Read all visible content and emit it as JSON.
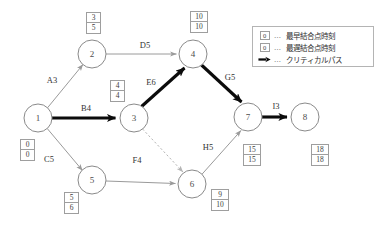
{
  "diagram": {
    "type": "pert-cpm-network",
    "nodes": [
      {
        "id": "1",
        "label": "1",
        "cx": 38,
        "cy": 118,
        "r": 14,
        "earliest": "0",
        "latest": "0",
        "box_x": 20,
        "box_y": 139
      },
      {
        "id": "2",
        "label": "2",
        "cx": 92,
        "cy": 54,
        "r": 14,
        "earliest": "3",
        "latest": "5",
        "box_x": 86,
        "box_y": 12
      },
      {
        "id": "3",
        "label": "3",
        "cx": 134,
        "cy": 118,
        "r": 14,
        "earliest": "4",
        "latest": "4",
        "box_x": 110,
        "box_y": 80
      },
      {
        "id": "4",
        "label": "4",
        "cx": 193,
        "cy": 54,
        "r": 14,
        "earliest": "10",
        "latest": "10",
        "box_x": 190,
        "box_y": 11
      },
      {
        "id": "5",
        "label": "5",
        "cx": 92,
        "cy": 180,
        "r": 14,
        "earliest": "5",
        "latest": "6",
        "box_x": 64,
        "box_y": 192
      },
      {
        "id": "6",
        "label": "6",
        "cx": 192,
        "cy": 184,
        "r": 14,
        "earliest": "9",
        "latest": "10",
        "box_x": 211,
        "box_y": 189
      },
      {
        "id": "7",
        "label": "7",
        "cx": 248,
        "cy": 117,
        "r": 14,
        "earliest": "15",
        "latest": "15",
        "box_x": 243,
        "box_y": 144
      },
      {
        "id": "8",
        "label": "8",
        "cx": 305,
        "cy": 117,
        "r": 14,
        "earliest": "18",
        "latest": "18",
        "box_x": 311,
        "box_y": 144
      }
    ],
    "edges": [
      {
        "name": "A3",
        "from": "1",
        "to": "2",
        "label": "A3",
        "duration": 3,
        "critical": false,
        "dummy": false,
        "label_x": 52,
        "label_y": 83
      },
      {
        "name": "B4",
        "from": "1",
        "to": "3",
        "label": "B4",
        "duration": 4,
        "critical": true,
        "dummy": false,
        "label_x": 86,
        "label_y": 111
      },
      {
        "name": "C5",
        "from": "1",
        "to": "5",
        "label": "C5",
        "duration": 5,
        "critical": false,
        "dummy": false,
        "label_x": 49,
        "label_y": 162
      },
      {
        "name": "D5",
        "from": "2",
        "to": "4",
        "label": "D5",
        "duration": 5,
        "critical": false,
        "dummy": false,
        "label_x": 145,
        "label_y": 48
      },
      {
        "name": "E6",
        "from": "3",
        "to": "4",
        "label": "E6",
        "duration": 6,
        "critical": true,
        "dummy": false,
        "label_x": 151,
        "label_y": 85
      },
      {
        "name": "G5",
        "from": "4",
        "to": "7",
        "label": "G5",
        "duration": 5,
        "critical": true,
        "dummy": false,
        "label_x": 230,
        "label_y": 80
      },
      {
        "name": "F4",
        "from": "5",
        "to": "6",
        "label": "F4",
        "duration": 4,
        "critical": false,
        "dummy": false,
        "label_x": 137,
        "label_y": 163
      },
      {
        "name": "H5",
        "from": "6",
        "to": "7",
        "label": "H5",
        "duration": 5,
        "critical": false,
        "dummy": false,
        "label_x": 208,
        "label_y": 150
      },
      {
        "name": "I3",
        "from": "7",
        "to": "8",
        "label": "I3",
        "duration": 3,
        "critical": true,
        "dummy": false,
        "label_x": 276,
        "label_y": 109
      },
      {
        "name": "dummy-3-6",
        "from": "3",
        "to": "6",
        "label": "",
        "duration": 0,
        "critical": false,
        "dummy": true,
        "label_x": 0,
        "label_y": 0
      }
    ],
    "critical_path": [
      "1",
      "3",
      "4",
      "7",
      "8"
    ]
  },
  "legend": {
    "rows": [
      {
        "symbol": "box",
        "value": "0",
        "dots": "…",
        "text": "最早結合点時刻"
      },
      {
        "symbol": "box",
        "value": "0",
        "dots": "…",
        "text": "最遅結合点時刻"
      },
      {
        "symbol": "arrow",
        "value": "",
        "dots": "…",
        "text": "クリティカルパス"
      }
    ]
  },
  "colors": {
    "node_stroke": "#8a8a8a",
    "edge_normal": "#9a9a9a",
    "edge_critical": "#0b0b0b",
    "edge_dummy": "#b5b5b5",
    "box_border": "#9e9e9e",
    "background": "#ffffff"
  }
}
